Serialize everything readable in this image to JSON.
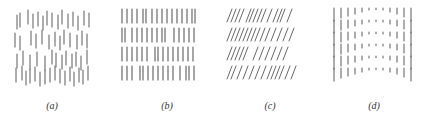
{
  "figure": {
    "panels": [
      {
        "id": "a",
        "caption": "(a)",
        "description": "randomly offset vertical line segments",
        "x": 0,
        "width": 110,
        "caption_x": 32,
        "caption_y": 100,
        "stroke": "#6a6a6a",
        "rows": [
          {
            "y": 10,
            "len": 14,
            "xs": [
              17,
              20,
              28,
              33,
              38,
              43,
              47,
              52,
              58,
              62,
              68,
              73,
              78,
              84,
              89
            ],
            "jitter": [
              5,
              3,
              0,
              4,
              2,
              6,
              1,
              3,
              5,
              0,
              4,
              2,
              6,
              1,
              3
            ]
          },
          {
            "y": 30,
            "len": 14,
            "xs": [
              15,
              20,
              31,
              36,
              42,
              49,
              55,
              60,
              64,
              70,
              77,
              82,
              87
            ],
            "jitter": [
              3,
              6,
              1,
              4,
              0,
              5,
              2,
              6,
              0,
              3,
              5,
              1,
              4
            ]
          },
          {
            "y": 50,
            "len": 14,
            "xs": [
              17,
              23,
              30,
              37,
              45,
              52,
              56,
              62,
              66,
              72,
              76,
              81,
              87
            ],
            "jitter": [
              4,
              1,
              5,
              2,
              6,
              0,
              3,
              5,
              1,
              4,
              2,
              6,
              0
            ]
          },
          {
            "y": 66,
            "len": 14,
            "xs": [
              16,
              22,
              26,
              30,
              35,
              40,
              45,
              50,
              55,
              60,
              65,
              70,
              74,
              79,
              83,
              88
            ],
            "jitter": [
              2,
              0,
              5,
              3,
              1,
              6,
              4,
              2,
              0,
              3,
              5,
              1,
              6,
              2,
              4,
              0
            ]
          }
        ]
      },
      {
        "id": "b",
        "caption": "(b)",
        "description": "regular grid of vertical line segments",
        "x": 110,
        "width": 105,
        "caption_x": 147,
        "caption_y": 100,
        "stroke": "#6a6a6a",
        "rows": [
          {
            "y": 9,
            "len": 14,
            "xs": [
              12,
              17,
              22,
              27,
              33,
              36,
              42,
              47,
              52,
              57,
              62,
              67,
              72,
              77,
              82,
              85
            ]
          },
          {
            "y": 28,
            "len": 14,
            "xs": [
              12,
              15,
              22,
              27,
              32,
              37,
              42,
              47,
              52,
              55,
              64,
              69,
              74,
              79,
              84
            ]
          },
          {
            "y": 47,
            "len": 14,
            "xs": [
              12,
              17,
              22,
              27,
              32,
              37,
              45,
              48,
              53,
              58,
              63,
              68,
              73,
              78,
              83
            ]
          },
          {
            "y": 66,
            "len": 14,
            "xs": [
              12,
              17,
              22,
              30,
              33,
              38,
              43,
              48,
              53,
              58,
              63,
              70,
              76,
              79,
              84
            ]
          }
        ]
      },
      {
        "id": "c",
        "caption": "(c)",
        "description": "slanted line segments",
        "x": 215,
        "width": 105,
        "caption_x": 250,
        "caption_y": 100,
        "stroke": "#6a6a6a",
        "rows": [
          {
            "y": 9,
            "len": 13,
            "xs": [
              14,
              18,
              22,
              26,
              33,
              36,
              40,
              44,
              48,
              54,
              60,
              64,
              67,
              74
            ]
          },
          {
            "y": 28,
            "len": 13,
            "xs": [
              14,
              18,
              22,
              26,
              30,
              34,
              38,
              42,
              47,
              52,
              58,
              64,
              70,
              76
            ]
          },
          {
            "y": 47,
            "len": 13,
            "xs": [
              14,
              18,
              22,
              26,
              30,
              40,
              46,
              52,
              58,
              64,
              70
            ]
          },
          {
            "y": 66,
            "len": 13,
            "xs": [
              14,
              18,
              24,
              30,
              36,
              42,
              48,
              54,
              58,
              62,
              66,
              72,
              78
            ]
          }
        ]
      },
      {
        "id": "d",
        "caption": "(d)",
        "description": "vertical segments with length varying across width (long at edges, short dots at center)",
        "x": 320,
        "width": 105,
        "caption_x": 354,
        "caption_y": 100,
        "stroke": "#6a6a6a",
        "columns": [
          {
            "x": 14,
            "len": 13
          },
          {
            "x": 21,
            "len": 10
          },
          {
            "x": 28,
            "len": 8
          },
          {
            "x": 35,
            "len": 6
          },
          {
            "x": 42,
            "len": 4
          },
          {
            "x": 49,
            "len": 2
          },
          {
            "x": 56,
            "len": 1.5
          },
          {
            "x": 63,
            "len": 2
          },
          {
            "x": 70,
            "len": 4
          },
          {
            "x": 77,
            "len": 6
          },
          {
            "x": 84,
            "len": 9
          },
          {
            "x": 91,
            "len": 13
          }
        ],
        "rows_y": [
          8,
          20,
          32,
          44,
          56,
          68
        ]
      }
    ]
  }
}
